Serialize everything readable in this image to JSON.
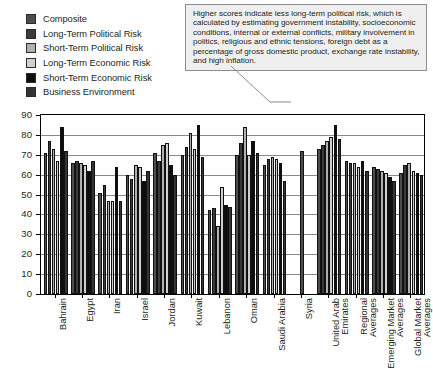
{
  "legend": {
    "items": [
      {
        "label": "Composite",
        "color": "#4d4d4d",
        "swatch_name": "legend-swatch-composite"
      },
      {
        "label": "Long-Term Political Risk",
        "color": "#3a3a3a",
        "swatch_name": "legend-swatch-long-term-political-risk"
      },
      {
        "label": "Short-Term Political Risk",
        "color": "#b0b0b0",
        "swatch_name": "legend-swatch-short-term-political-risk"
      },
      {
        "label": "Long-Term Economic Risk",
        "color": "#cfcfcf",
        "swatch_name": "legend-swatch-long-term-economic-risk"
      },
      {
        "label": "Short-Term Economic Risk",
        "color": "#0d0d0d",
        "swatch_name": "legend-swatch-short-term-economic-risk"
      },
      {
        "label": "Business Environment",
        "color": "#333333",
        "swatch_name": "legend-swatch-business-environment"
      }
    ]
  },
  "callout": {
    "text": "Higher scores indicate less long-term political risk, which is calculated by estimating government instability, socioeconomic conditions, internal or external conflicts, military involvement in politics, religious and ethnic tensions, foreign debt as a percentage of gross domestic product, exchange rate instability, and high inflation.",
    "background": "#efefef",
    "border": "#8d8d8d"
  },
  "chart_data": {
    "type": "bar",
    "title": "",
    "xlabel": "",
    "ylabel": "",
    "ylim": [
      0,
      90
    ],
    "yticks": [
      0,
      10,
      20,
      30,
      40,
      50,
      60,
      70,
      80,
      90
    ],
    "grid": true,
    "legend_position": "top-left",
    "categories": [
      "Bahrain",
      "Egypt",
      "Iran",
      "Israel",
      "Jordan",
      "Kuwait",
      "Lebanon",
      "Oman",
      "Saudi Arabia",
      "Syria",
      "United Arab Emirates",
      "Regional Averages",
      "Emerging Market Averages",
      "Global Market Averages"
    ],
    "series": [
      {
        "name": "Composite",
        "color": "#4d4d4d",
        "values": [
          71,
          66,
          51,
          60,
          71,
          70,
          42,
          70,
          65,
          72,
          73,
          67,
          64,
          61
        ]
      },
      {
        "name": "Long-Term Political Risk",
        "color": "#3a3a3a",
        "values": [
          77,
          67,
          55,
          58,
          67,
          74,
          43,
          76,
          68,
          null,
          75,
          66,
          63,
          65
        ]
      },
      {
        "name": "Short-Term Political Risk",
        "color": "#b0b0b0",
        "values": [
          73,
          66,
          47,
          65,
          75,
          81,
          34,
          84,
          69,
          null,
          77,
          66,
          62,
          66
        ]
      },
      {
        "name": "Long-Term Economic Risk",
        "color": "#cfcfcf",
        "values": [
          67,
          65,
          47,
          64,
          76,
          73,
          54,
          70,
          68,
          null,
          79,
          64,
          61,
          62
        ]
      },
      {
        "name": "Short-Term Economic Risk",
        "color": "#0d0d0d",
        "values": [
          84,
          62,
          64,
          57,
          65,
          85,
          45,
          77,
          66,
          null,
          85,
          67,
          59,
          61
        ]
      },
      {
        "name": "Business Environment",
        "color": "#333333",
        "values": [
          72,
          67,
          47,
          62,
          60,
          69,
          44,
          71,
          57,
          null,
          78,
          62,
          57,
          60
        ]
      }
    ]
  }
}
